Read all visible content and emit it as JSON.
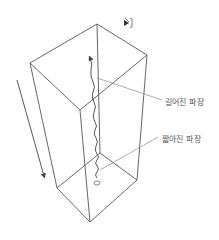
{
  "diagram": {
    "title": "",
    "labels": {
      "lengthened_wavelength": "길어진 파장",
      "shortened_wavelength": "짧아진 파장",
      "source": "(Q)"
    },
    "icons": {
      "observer": "observer-icon",
      "motion_arrow": "down-arrow-icon"
    },
    "colors": {
      "line": "#555555",
      "leader": "#888888",
      "background": "#ffffff"
    }
  }
}
